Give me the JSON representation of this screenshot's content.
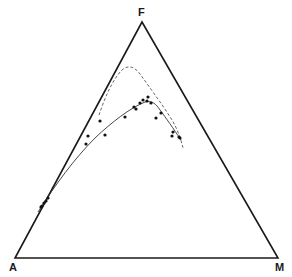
{
  "diagram": {
    "type": "ternary",
    "vertices": {
      "top": {
        "label": "F",
        "x": 142,
        "y": 22
      },
      "left": {
        "label": "A",
        "x": 15,
        "y": 258
      },
      "right": {
        "label": "M",
        "x": 278,
        "y": 258
      }
    },
    "colors": {
      "frame": "#1a1a1a",
      "points": "#111111",
      "upper_trend": "#555555",
      "lower_trend": "#333333"
    },
    "upper_trend_path": "M99,115 C104,100 112,80 122,70 C128,65 134,66 140,74 C150,88 162,104 172,120 C178,130 181,140 183,148",
    "lower_trend_path": "M38,212 C55,185 75,158 95,138 C112,122 130,108 145,102 C152,100 156,104 160,110 C166,118 173,128 181,140",
    "points": [
      [
        100,
        121
      ],
      [
        88,
        136
      ],
      [
        86,
        144
      ],
      [
        105,
        135
      ],
      [
        125,
        117
      ],
      [
        134,
        107
      ],
      [
        136,
        109
      ],
      [
        140,
        103
      ],
      [
        143,
        100
      ],
      [
        148,
        97
      ],
      [
        147,
        101
      ],
      [
        151,
        103
      ],
      [
        156,
        118
      ],
      [
        161,
        113
      ],
      [
        172,
        136
      ],
      [
        173,
        132
      ],
      [
        179,
        137
      ],
      [
        180,
        138
      ],
      [
        48,
        198
      ],
      [
        44,
        203
      ],
      [
        41,
        207
      ],
      [
        46,
        201
      ],
      [
        42,
        206
      ]
    ]
  }
}
